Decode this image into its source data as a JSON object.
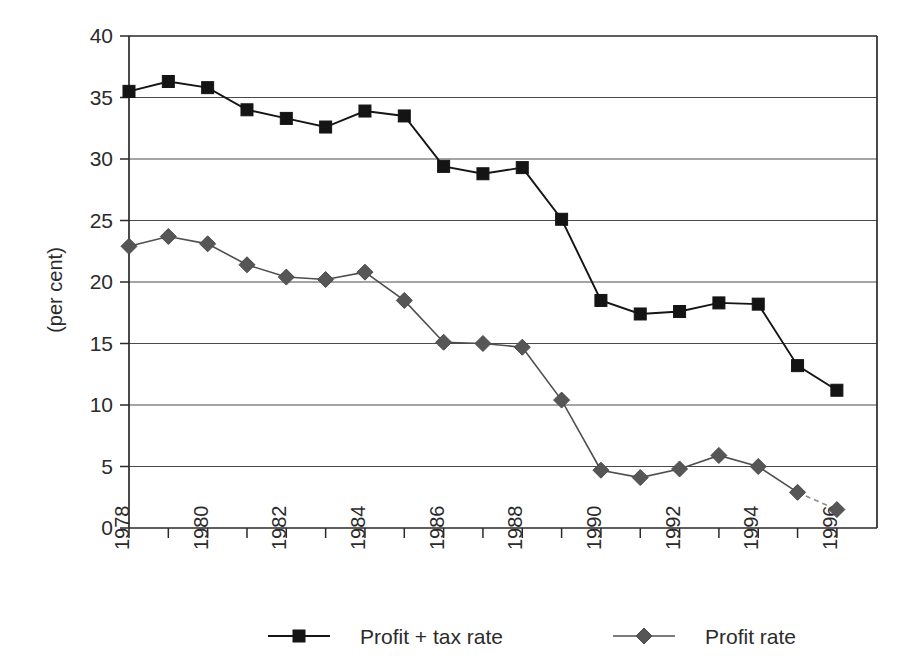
{
  "chart_data": {
    "type": "line",
    "title": "",
    "subtitle": "",
    "xlabel": "",
    "ylabel": "(per cent)",
    "ylim": [
      0,
      40
    ],
    "ytick_step": 5,
    "yticks": [
      0,
      5,
      10,
      15,
      20,
      25,
      30,
      35,
      40
    ],
    "ytick_labels": [
      "0",
      "5",
      "10",
      "15",
      "20",
      "25",
      "30",
      "35",
      "40"
    ],
    "grid": "horizontal",
    "legend_position": "bottom",
    "x": [
      1978,
      1979,
      1980,
      1981,
      1982,
      1983,
      1984,
      1985,
      1986,
      1987,
      1988,
      1989,
      1990,
      1991,
      1992,
      1993,
      1994,
      1995,
      1996
    ],
    "xtick_labels": [
      "1978",
      "",
      "1980",
      "",
      "1982",
      "",
      "1984",
      "",
      "1986",
      "",
      "1988",
      "",
      "1990",
      "",
      "1992",
      "",
      "1994",
      "",
      "1996"
    ],
    "xtick_labels_shown": [
      "1978",
      "1980",
      "1982",
      "1984",
      "1986",
      "1988",
      "1990",
      "1992",
      "1994",
      "1996"
    ],
    "xtick_rotation": 90,
    "series": [
      {
        "name": "Profit + tax rate",
        "marker": "square",
        "color": "#141414",
        "values": [
          35.5,
          36.3,
          35.8,
          34.0,
          33.3,
          32.6,
          33.9,
          33.5,
          29.4,
          28.8,
          29.3,
          25.1,
          18.5,
          17.4,
          17.6,
          18.3,
          18.2,
          13.2,
          11.2
        ]
      },
      {
        "name": "Profit rate",
        "marker": "diamond",
        "color": "#565656",
        "last_segment_dashed": true,
        "values": [
          22.9,
          23.7,
          23.1,
          21.4,
          20.4,
          20.2,
          20.8,
          18.5,
          15.1,
          15.0,
          14.7,
          10.4,
          4.7,
          4.1,
          4.8,
          5.9,
          5.0,
          2.9,
          1.5
        ]
      }
    ]
  },
  "legend": {
    "items": [
      {
        "label": "Profit + tax rate"
      },
      {
        "label": "Profit rate"
      }
    ]
  },
  "axes": {
    "y_title": "(per cent)"
  }
}
